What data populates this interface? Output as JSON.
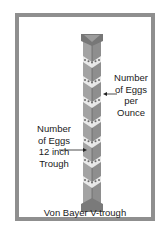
{
  "diagram": {
    "title": "Von Bayer V-trough",
    "labels": {
      "right": [
        "Number",
        "of Eggs",
        "per",
        "Ounce"
      ],
      "left": [
        "Number",
        "of Eggs",
        "12 inch",
        "Trough"
      ]
    },
    "egg_clusters": 7,
    "colors": {
      "frame": "#8f8f8f",
      "trough": "#9a9a9a",
      "trough_dark": "#7d7d7d",
      "cap": "#6e6e6e",
      "egg": "#f2f2f2",
      "text": "#1a1a1a"
    }
  }
}
